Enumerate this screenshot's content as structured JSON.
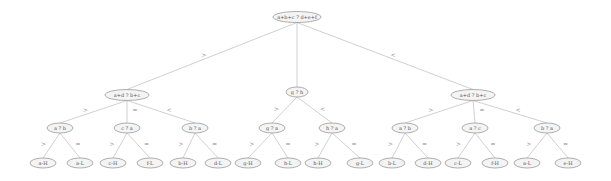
{
  "diagram": {
    "type": "decision-tree",
    "root": {
      "id": "root",
      "label": "a+b+c ? d+e+f",
      "children": [
        {
          "edge": ">",
          "node": {
            "id": "n1",
            "label": "a+d ? b+c",
            "children": [
              {
                "edge": ">",
                "node": {
                  "id": "n1a",
                  "label": "a ? b",
                  "children": [
                    {
                      "edge": ">",
                      "node": {
                        "id": "l1",
                        "label": "a-H"
                      }
                    },
                    {
                      "edge": "=",
                      "node": {
                        "id": "l2",
                        "label": "a-L"
                      }
                    }
                  ]
                }
              },
              {
                "edge": "=",
                "node": {
                  "id": "n1b",
                  "label": "c ? a",
                  "children": [
                    {
                      "edge": ">",
                      "node": {
                        "id": "l3",
                        "label": "c-H"
                      }
                    },
                    {
                      "edge": "=",
                      "node": {
                        "id": "l4",
                        "label": "f-L"
                      }
                    }
                  ]
                }
              },
              {
                "edge": "<",
                "node": {
                  "id": "n1c",
                  "label": "b ? a",
                  "children": [
                    {
                      "edge": ">",
                      "node": {
                        "id": "l5",
                        "label": "b-H"
                      }
                    },
                    {
                      "edge": "=",
                      "node": {
                        "id": "l6",
                        "label": "d-L"
                      }
                    }
                  ]
                }
              }
            ]
          }
        },
        {
          "edge": "",
          "node": {
            "id": "n2",
            "label": "g ? h",
            "children": [
              {
                "edge": ">",
                "node": {
                  "id": "n2a",
                  "label": "g ? a",
                  "children": [
                    {
                      "edge": ">",
                      "node": {
                        "id": "l7",
                        "label": "g-H"
                      }
                    },
                    {
                      "edge": "=",
                      "node": {
                        "id": "l8",
                        "label": "h-L"
                      }
                    }
                  ]
                }
              },
              {
                "edge": "<",
                "node": {
                  "id": "n2b",
                  "label": "h ? a",
                  "children": [
                    {
                      "edge": ">",
                      "node": {
                        "id": "l9",
                        "label": "h-H"
                      }
                    },
                    {
                      "edge": "=",
                      "node": {
                        "id": "l10",
                        "label": "g-L"
                      }
                    }
                  ]
                }
              }
            ]
          }
        },
        {
          "edge": "<",
          "node": {
            "id": "n3",
            "label": "a+d ? b+c",
            "children": [
              {
                "edge": ">",
                "node": {
                  "id": "n3a",
                  "label": "a ? b",
                  "children": [
                    {
                      "edge": ">",
                      "node": {
                        "id": "l11",
                        "label": "b-L"
                      }
                    },
                    {
                      "edge": "=",
                      "node": {
                        "id": "l12",
                        "label": "d-H"
                      }
                    }
                  ]
                }
              },
              {
                "edge": "=",
                "node": {
                  "id": "n3b",
                  "label": "a ? c",
                  "children": [
                    {
                      "edge": ">",
                      "node": {
                        "id": "l13",
                        "label": "c-L"
                      }
                    },
                    {
                      "edge": "=",
                      "node": {
                        "id": "l14",
                        "label": "f-H"
                      }
                    }
                  ]
                }
              },
              {
                "edge": "<",
                "node": {
                  "id": "n3c",
                  "label": "b ? a",
                  "children": [
                    {
                      "edge": ">",
                      "node": {
                        "id": "l15",
                        "label": "a-L"
                      }
                    },
                    {
                      "edge": "=",
                      "node": {
                        "id": "l16",
                        "label": "e-H"
                      }
                    }
                  ]
                }
              }
            ]
          }
        }
      ]
    }
  }
}
